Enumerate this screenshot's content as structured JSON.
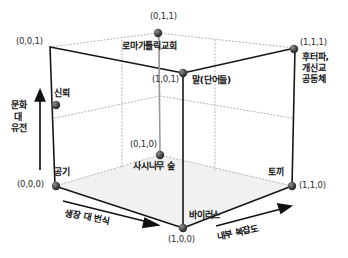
{
  "figure": {
    "type": "3d-cube-diagram",
    "line_color": "#1a1a1a",
    "hidden_line_color": "#b0b0b0",
    "floor_fill": "#f2f2f2",
    "dot_color": "#3a3a3a"
  },
  "axes": [
    {
      "id": "vertical",
      "label": "문화\n대\n유전"
    },
    {
      "id": "depth",
      "label": "생장 대 번식"
    },
    {
      "id": "horizontal",
      "label": "내부 복잡도"
    }
  ],
  "vertices": [
    {
      "id": "v001",
      "coord": "(0,0,1)",
      "name": ""
    },
    {
      "id": "v011",
      "coord": "(0,1,1)",
      "name": "로마가톨릭교회"
    },
    {
      "id": "v111",
      "coord": "(1,1,1)",
      "name": "후터파,\n개신교\n공동체"
    },
    {
      "id": "v101",
      "coord": "(1,0,1)",
      "name": "말(단어들)"
    },
    {
      "id": "v000",
      "coord": "(0,0,0)",
      "name": "공기"
    },
    {
      "id": "v010",
      "coord": "(0,1,0)",
      "name": "사시나무 숲"
    },
    {
      "id": "v110",
      "coord": "(1,1,0)",
      "name": "토끼"
    },
    {
      "id": "v100",
      "coord": "(1,0,0)",
      "name": "바이러스"
    },
    {
      "id": "vmid",
      "coord": "",
      "name": "신뢰"
    }
  ]
}
